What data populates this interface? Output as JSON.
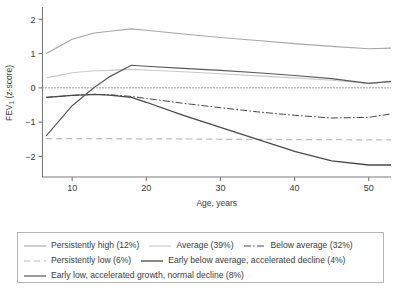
{
  "chart_data": {
    "type": "line",
    "title": "",
    "xlabel": "Age, years",
    "ylabel": "FEV1 (z-score)",
    "ylabel_base": "FEV",
    "ylabel_sub": "1",
    "ylabel_rest": " (z-score)",
    "xlim": [
      6,
      53
    ],
    "ylim": [
      -2.6,
      2.3
    ],
    "xticks": [
      10,
      20,
      30,
      40,
      50
    ],
    "yticks": [
      2,
      1,
      0,
      -1,
      -2
    ],
    "grid": false,
    "legend_position": "below-plot",
    "reference_lines": [
      {
        "name": "zero-line",
        "y": 0,
        "style": "dotted",
        "color": "#4a4a4a"
      }
    ],
    "x": [
      6.5,
      10,
      13,
      15,
      18,
      20,
      25,
      30,
      35,
      40,
      45,
      50,
      53
    ],
    "series": [
      {
        "name": "Persistently high (12%)",
        "label": "Persistently high (12%)",
        "percent": "12%",
        "style": "solid",
        "color": "#a8a8a8",
        "width": 1.1,
        "values": [
          1.0,
          1.42,
          1.6,
          1.65,
          1.72,
          1.68,
          1.57,
          1.47,
          1.38,
          1.29,
          1.21,
          1.14,
          1.16
        ]
      },
      {
        "name": "Average (39%)",
        "label": "Average (39%)",
        "percent": "39%",
        "style": "solid",
        "color": "#c9c9c9",
        "width": 1.1,
        "values": [
          0.29,
          0.44,
          0.5,
          0.51,
          0.54,
          0.52,
          0.47,
          0.41,
          0.35,
          0.29,
          0.22,
          0.13,
          0.17
        ]
      },
      {
        "name": "Below average (32%)",
        "label": "Below average (32%)",
        "percent": "32%",
        "style": "dashdot",
        "color": "#4a4a4a",
        "width": 1.0,
        "values": [
          -0.28,
          -0.22,
          -0.19,
          -0.2,
          -0.25,
          -0.31,
          -0.45,
          -0.58,
          -0.7,
          -0.8,
          -0.88,
          -0.86,
          -0.76
        ]
      },
      {
        "name": "Persistently low (6%)",
        "label": "Persistently low (6%)",
        "percent": "6%",
        "style": "dashed",
        "color": "#bdbdbd",
        "width": 1.2,
        "values": [
          -1.48,
          -1.48,
          -1.48,
          -1.48,
          -1.49,
          -1.49,
          -1.49,
          -1.5,
          -1.5,
          -1.51,
          -1.51,
          -1.52,
          -1.52
        ]
      },
      {
        "name": "Early below average, accelerated decline (4%)",
        "label": "Early below average, accelerated decline (4%)",
        "percent": "4%",
        "style": "solid",
        "color": "#4a4a4a",
        "width": 1.3,
        "values": [
          -0.28,
          -0.22,
          -0.19,
          -0.21,
          -0.28,
          -0.42,
          -0.8,
          -1.15,
          -1.5,
          -1.85,
          -2.13,
          -2.25,
          -2.25
        ]
      },
      {
        "name": "Early low, accelerated growth, normal decline (8%)",
        "label": "Early low, accelerated growth, normal decline (8%)",
        "percent": "8%",
        "style": "solid",
        "color": "#5a5a5a",
        "width": 1.2,
        "values": [
          -1.4,
          -0.52,
          0.02,
          0.32,
          0.66,
          0.63,
          0.57,
          0.51,
          0.44,
          0.36,
          0.27,
          0.13,
          0.19
        ]
      }
    ]
  },
  "legend": {
    "rows": [
      [
        "Persistently high (12%)",
        "Average (39%)",
        "Below average (32%)"
      ],
      [
        "Persistently low (6%)",
        "Early below average, accelerated decline (4%)"
      ],
      [
        "Early low, accelerated growth, normal decline (8%)"
      ]
    ]
  }
}
